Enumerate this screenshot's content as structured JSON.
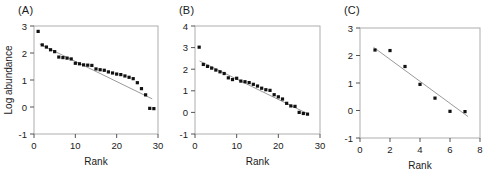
{
  "figure": {
    "panels": [
      {
        "label": "(A)",
        "chart_data": {
          "type": "scatter",
          "title": "",
          "xlabel": "Rank",
          "ylabel": "Log abundance",
          "xlim": [
            0,
            30
          ],
          "ylim": [
            -1,
            3
          ],
          "xticks": [
            0,
            10,
            20,
            30
          ],
          "yticks": [
            -1,
            0,
            1,
            2,
            3
          ],
          "grid": false,
          "legend": "none",
          "series": [
            {
              "name": "observed",
              "marker": "square",
              "color": "#111111",
              "x": [
                1,
                2,
                3,
                4,
                5,
                6,
                7,
                8,
                9,
                10,
                11,
                12,
                13,
                14,
                15,
                16,
                17,
                18,
                19,
                20,
                21,
                22,
                23,
                24,
                25,
                26,
                27,
                28,
                29
              ],
              "y": [
                2.8,
                2.3,
                2.22,
                2.12,
                2.05,
                1.85,
                1.83,
                1.81,
                1.78,
                1.62,
                1.6,
                1.56,
                1.55,
                1.54,
                1.41,
                1.38,
                1.36,
                1.3,
                1.26,
                1.22,
                1.2,
                1.15,
                1.1,
                1.05,
                0.9,
                0.68,
                0.45,
                -0.05,
                -0.06
              ]
            },
            {
              "name": "fitted line",
              "type": "line",
              "color": "#9a9a9a",
              "x": [
                1.4,
                28.6
              ],
              "y": [
                2.33,
                0.3
              ]
            }
          ]
        }
      },
      {
        "label": "(B)",
        "chart_data": {
          "type": "scatter",
          "title": "",
          "xlabel": "Rank",
          "ylabel": "",
          "xlim": [
            0,
            30
          ],
          "ylim": [
            -1,
            4
          ],
          "xticks": [
            0,
            10,
            20,
            30
          ],
          "yticks": [
            -1,
            0,
            1,
            2,
            3,
            4
          ],
          "grid": false,
          "legend": "none",
          "series": [
            {
              "name": "observed",
              "marker": "square",
              "color": "#111111",
              "x": [
                1,
                2,
                3,
                4,
                5,
                6,
                7,
                8,
                9,
                10,
                11,
                12,
                13,
                14,
                15,
                16,
                17,
                18,
                19,
                20,
                21,
                22,
                23,
                24,
                25,
                26,
                27
              ],
              "y": [
                3.02,
                2.22,
                2.13,
                2.05,
                1.96,
                1.88,
                1.8,
                1.6,
                1.52,
                1.58,
                1.45,
                1.42,
                1.38,
                1.3,
                1.22,
                1.12,
                1.05,
                1.02,
                0.82,
                0.72,
                0.62,
                0.42,
                0.3,
                0.28,
                0.0,
                -0.05,
                -0.08
              ]
            },
            {
              "name": "fitted line",
              "type": "line",
              "color": "#9a9a9a",
              "x": [
                1.1,
                26.9
              ],
              "y": [
                2.38,
                -0.05
              ]
            }
          ]
        }
      },
      {
        "label": "(C)",
        "chart_data": {
          "type": "scatter",
          "title": "",
          "xlabel": "Rank",
          "ylabel": "",
          "xlim": [
            0,
            8
          ],
          "ylim": [
            -1,
            3
          ],
          "xticks": [
            0,
            2,
            4,
            6,
            8
          ],
          "yticks": [
            -1,
            0,
            1,
            2,
            3
          ],
          "grid": false,
          "legend": "none",
          "series": [
            {
              "name": "observed",
              "marker": "square",
              "color": "#111111",
              "x": [
                1,
                2,
                3,
                4,
                5,
                6,
                7
              ],
              "y": [
                2.2,
                2.18,
                1.6,
                0.95,
                0.45,
                -0.03,
                -0.04
              ]
            },
            {
              "name": "fitted line",
              "type": "line",
              "color": "#9a9a9a",
              "x": [
                0.9,
                7.2
              ],
              "y": [
                2.3,
                -0.22
              ]
            }
          ]
        }
      }
    ]
  }
}
